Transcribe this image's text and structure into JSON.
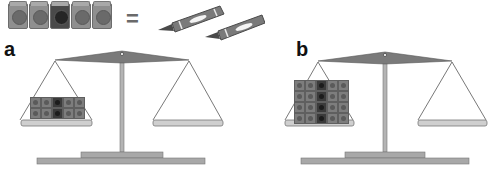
{
  "equation": {
    "cube_strip": {
      "count": 5,
      "dark_index": 2,
      "colors": {
        "light": "#8f8f8f",
        "dark": "#4a4a4a"
      }
    },
    "equals_sign": "=",
    "crayons": {
      "count": 2,
      "color": "#7a7a7a"
    }
  },
  "scales": [
    {
      "label": "a",
      "left_pan": {
        "rows": 2,
        "cols": 5,
        "dark_col": 2,
        "total_cubes": 10
      },
      "right_pan": {
        "contents": "empty"
      }
    },
    {
      "label": "b",
      "left_pan": {
        "rows": 4,
        "cols": 5,
        "dark_col": 2,
        "total_cubes": 20
      },
      "right_pan": {
        "contents": "empty"
      }
    }
  ],
  "colors": {
    "scale_beam": "#7a7a7a",
    "scale_post": "#b4b4b4",
    "scale_pan": "#cfcfcf",
    "scale_base": "#a8a8a8",
    "string": "#555555"
  }
}
